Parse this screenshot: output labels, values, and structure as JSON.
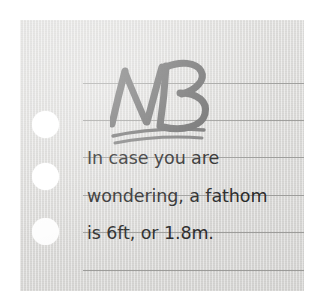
{
  "note": {
    "name": "ruled-paper-note",
    "paper_color": "#dddcda",
    "rule_line_color": "#9a9a98",
    "marker_color": "#6f6f6f",
    "text_color": "#2b2b2b",
    "hole_color": "#ffffff",
    "background_color": "#ffffff",
    "heading": {
      "text": "NB",
      "style": "handwritten-marker",
      "underline_strokes": 2
    },
    "body_lines": [
      "In case you are",
      "wondering, a fathom",
      "is 6ft, or 1.8m."
    ],
    "full_text": "NB In case you are wondering, a fathom is 6ft, or 1.8m.",
    "rule_line_y": [
      83,
      120,
      157,
      195,
      232,
      270
    ],
    "punch_holes": [
      {
        "cx": 46,
        "cy": 125,
        "d": 27
      },
      {
        "cx": 46,
        "cy": 177,
        "d": 27
      },
      {
        "cx": 46,
        "cy": 232,
        "d": 27
      }
    ]
  }
}
